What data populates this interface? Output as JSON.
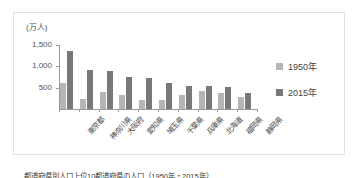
{
  "figure": {
    "unit_label": "(万人)",
    "caption": "都道府県別人口上位10都道府県の人口（1950年・2015年）"
  },
  "legend": {
    "position": "right",
    "items": [
      {
        "label": "1950年",
        "color": "#b5b5b5"
      },
      {
        "label": "2015年",
        "color": "#787878"
      }
    ]
  },
  "chart_data": {
    "type": "bar",
    "title": "",
    "subtitle": "",
    "xlabel": "",
    "ylabel": "(万人)",
    "ylim": [
      0,
      1500
    ],
    "yticks": [
      0,
      500,
      1000,
      1500
    ],
    "ytick_labels": [
      "0",
      "500",
      "1,000",
      "1,500"
    ],
    "grid": false,
    "legend_position": "right",
    "categories": [
      "東京都",
      "神奈川県",
      "大阪府",
      "愛知県",
      "埼玉県",
      "千葉県",
      "兵庫県",
      "北海道",
      "福岡県",
      "静岡県"
    ],
    "series": [
      {
        "name": "1950年",
        "color": "#b5b5b5",
        "values": [
          620,
          230,
          390,
          330,
          210,
          210,
          330,
          430,
          370,
          270
        ]
      },
      {
        "name": "2015年",
        "color": "#787878",
        "values": [
          1350,
          910,
          880,
          750,
          730,
          620,
          550,
          540,
          510,
          370
        ]
      }
    ]
  }
}
